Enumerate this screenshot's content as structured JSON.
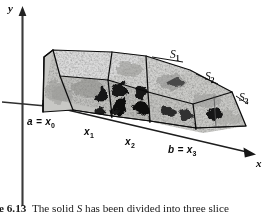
{
  "figure": {
    "number": "6.13",
    "caption_prefix": "ure",
    "caption_number": "6.13",
    "caption_text_1": "The solid",
    "caption_solid_symbol": "S",
    "caption_text_2": "has been divided into three slice",
    "caption_full_visible": "ure 6.13  The solid  S  has been divided into three slice"
  },
  "axes": {
    "y_label": "y",
    "x_label": "x",
    "y_axis_name": "vertical axis",
    "x_axis_name": "depth axis"
  },
  "slice_labels": [
    {
      "base": "S",
      "sub": "1",
      "text": "S1"
    },
    {
      "base": "S",
      "sub": "2",
      "text": "S2"
    },
    {
      "base": "S",
      "sub": "3",
      "text": "S3"
    }
  ],
  "partition_labels": [
    {
      "text": "a = x0",
      "lead": "a = x",
      "sub": "0"
    },
    {
      "text": "x1",
      "lead": "x",
      "sub": "1"
    },
    {
      "text": "x2",
      "lead": "x",
      "sub": "2"
    },
    {
      "text": "b = x3",
      "lead": "b = x",
      "sub": "3"
    }
  ],
  "colors": {
    "ink": "#0b0b0b",
    "paper": "#ffffff",
    "solid_fill_light": "#d8d8d6",
    "solid_fill_mid": "#b9b9b6",
    "solid_fill_dark": "#8f8f8c",
    "blotch": "#141414",
    "axis": "#2a2a2a"
  }
}
